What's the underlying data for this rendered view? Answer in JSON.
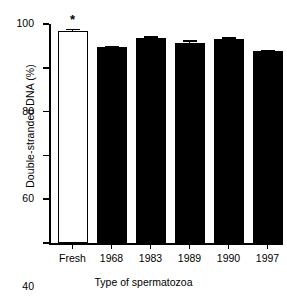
{
  "chart_data": {
    "type": "bar",
    "title": "",
    "xlabel": "Type of spermatozoa",
    "ylabel": "Double-stranded DNA (%)",
    "categories": [
      "Fresh",
      "1968",
      "1983",
      "1989",
      "1990",
      "1997"
    ],
    "values": [
      97.0,
      89.5,
      93.5,
      91.5,
      93.0,
      87.5
    ],
    "errors": [
      0.8,
      0.6,
      0.9,
      1.0,
      0.9,
      0.7
    ],
    "bar_styles": [
      "open",
      "filled",
      "filled",
      "filled",
      "filled",
      "filled"
    ],
    "annotations": [
      {
        "category": "Fresh",
        "text": "*",
        "kind": "significance-marker"
      }
    ],
    "ylim": [
      0,
      100
    ],
    "yticks": [
      0,
      20,
      40,
      60,
      80,
      100
    ],
    "yticklabels": [
      "0",
      "20",
      "40",
      "60",
      "80",
      "100"
    ],
    "grid": false,
    "legend": null,
    "colors": {
      "bar_fill": "#000000",
      "bar_open_fill": "#ffffff",
      "bar_edge": "#000000",
      "axis": "#000000",
      "background": "#ffffff"
    }
  }
}
